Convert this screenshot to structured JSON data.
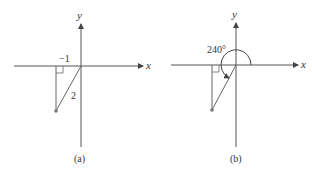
{
  "panels": [
    {
      "id": "a",
      "caption": "(a)",
      "x_label": "x",
      "y_label": "y",
      "leg_label": "−1",
      "hyp_label": "2",
      "point": {
        "x": -1,
        "y": -1.732
      }
    },
    {
      "id": "b",
      "caption": "(b)",
      "x_label": "x",
      "y_label": "y",
      "angle_label": "240°",
      "angle_deg": 240
    }
  ],
  "colors": {
    "axis": "#555555",
    "line": "#666666",
    "point": "#777777",
    "text": "#333333"
  }
}
